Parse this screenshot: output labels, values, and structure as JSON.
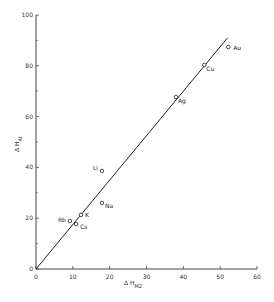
{
  "chart_data": {
    "type": "scatter",
    "title": "",
    "xlabel": "ΔH_M2",
    "ylabel": "ΔH_At",
    "xlim": [
      0,
      60
    ],
    "ylim": [
      0,
      100
    ],
    "x_ticks": [
      0,
      10,
      20,
      30,
      40,
      50,
      60
    ],
    "y_ticks": [
      0,
      20,
      40,
      60,
      80,
      100
    ],
    "grid": false,
    "legend": "none",
    "points": [
      {
        "label": "Au",
        "x": 52.2,
        "y": 87.4
      },
      {
        "label": "Cu",
        "x": 45.7,
        "y": 80.3
      },
      {
        "label": "Ag",
        "x": 38.0,
        "y": 67.7
      },
      {
        "label": "Li",
        "x": 17.9,
        "y": 38.6
      },
      {
        "label": "Na",
        "x": 17.9,
        "y": 26.0
      },
      {
        "label": "K",
        "x": 12.2,
        "y": 21.3
      },
      {
        "label": "Rb",
        "x": 9.2,
        "y": 18.9
      },
      {
        "label": "Cs",
        "x": 10.9,
        "y": 17.7
      }
    ],
    "fit_line": {
      "x": [
        0,
        52
      ],
      "y": [
        0,
        91
      ]
    }
  },
  "axes": {
    "x_title_main": "Δ H",
    "x_title_sub": "M2",
    "y_title_main": "Δ H",
    "y_title_sub": "At"
  }
}
